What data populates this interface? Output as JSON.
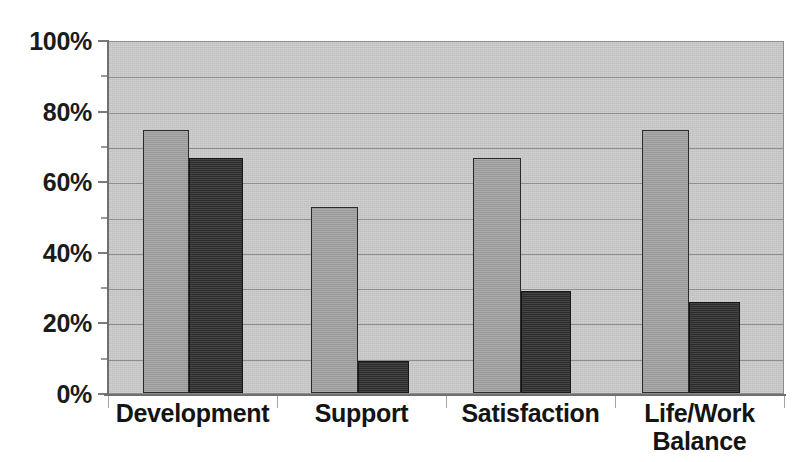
{
  "chart_data": {
    "type": "bar",
    "title": "",
    "subtitle": "",
    "xlabel": "",
    "ylabel": "",
    "categories": [
      "Development",
      "Support",
      "Satisfaction",
      "Life/Work Balance"
    ],
    "series": [
      {
        "name": "Series 1",
        "values": [
          75,
          53,
          67,
          75
        ],
        "color": "#a2a2a2"
      },
      {
        "name": "Series 2",
        "values": [
          67,
          9,
          29,
          26
        ],
        "color": "#2f2f2f"
      }
    ],
    "ylim": [
      0,
      100
    ],
    "y_tick_labels": [
      "0%",
      "20%",
      "40%",
      "60%",
      "80%",
      "100%"
    ],
    "y_tick_values": [
      0,
      20,
      40,
      60,
      80,
      100
    ],
    "y_minor_tick_values": [
      10,
      30,
      50,
      70,
      90
    ],
    "gridline_values": [
      10,
      20,
      30,
      40,
      50,
      60,
      70,
      80,
      90,
      100
    ],
    "grid": true,
    "legend": false,
    "legend_position": "none",
    "annotations": [],
    "value_suffix": "%"
  },
  "category_label_lines": [
    [
      "Development"
    ],
    [
      "Support"
    ],
    [
      "Satisfaction"
    ],
    [
      "Life/Work",
      "Balance"
    ]
  ],
  "colors": {
    "plot_background": "#c9c9c9",
    "gridline": "#8e8e8e",
    "axis": "#6f6f6f",
    "text": "#141414",
    "series_light": "#a2a2a2",
    "series_dark": "#2f2f2f",
    "page_background": "#ffffff"
  }
}
